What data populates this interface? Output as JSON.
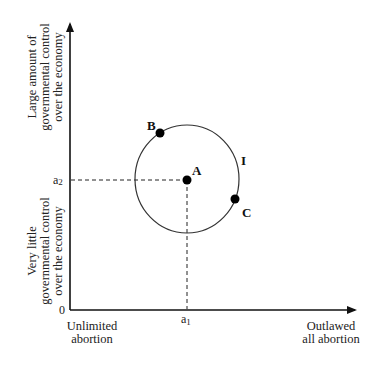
{
  "diagram": {
    "x_axis": {
      "left_label_line1": "Unlimited",
      "left_label_line2": "abortion",
      "right_label_line1": "Outlawed",
      "right_label_line2": "all abortion",
      "tick": "a",
      "tick_sub": "1"
    },
    "y_axis": {
      "top_label_line1": "Large amount of",
      "top_label_line2": "governmental control",
      "top_label_line3": "over the economy",
      "bottom_label_line1": "Very little",
      "bottom_label_line2": "governmental control",
      "bottom_label_line3": "over the economy",
      "tick": "a",
      "tick_sub": "2"
    },
    "origin_label": "0",
    "curve_label": "I",
    "points": [
      {
        "label": "A",
        "x": 187,
        "y": 180
      },
      {
        "label": "B",
        "x": 160,
        "y": 133
      },
      {
        "label": "C",
        "x": 235,
        "y": 199
      }
    ],
    "colors": {
      "axis": "#111111",
      "curve": "#333333",
      "background": "#ffffff"
    }
  }
}
